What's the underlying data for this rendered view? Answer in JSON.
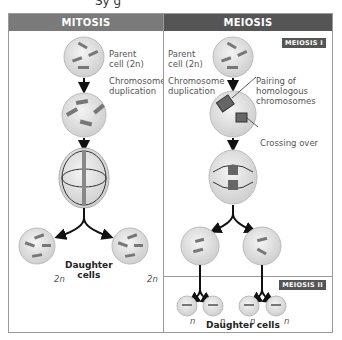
{
  "top_fragment": "Sy g",
  "mitosis": {
    "title": "MITOSIS",
    "header_color": "#7a7a7a",
    "labels": {
      "parent_cell": "Parent",
      "parent_cell_2": "cell (2n)",
      "duplication_1": "Chromosome",
      "duplication_2": "duplication",
      "daughter_1": "Daughter",
      "daughter_2": "cells",
      "ploidy_left": "2n",
      "ploidy_right": "2n"
    }
  },
  "meiosis": {
    "title": "MEIOSIS",
    "header_color": "#555555",
    "stage1_tag": "MEIOSIS I",
    "stage2_tag": "MEIOSIS II",
    "labels": {
      "parent_cell": "Parent",
      "parent_cell_2": "cell (2n)",
      "duplication_1": "Chromosome",
      "duplication_2": "duplication",
      "pairing_1": "Pairing of",
      "pairing_2": "homologous",
      "pairing_3": "chromosomes",
      "crossing_over": "Crossing over",
      "daughter_cells": "Daughter cells",
      "ploidy": [
        "n",
        "n",
        "n",
        "n"
      ]
    }
  }
}
